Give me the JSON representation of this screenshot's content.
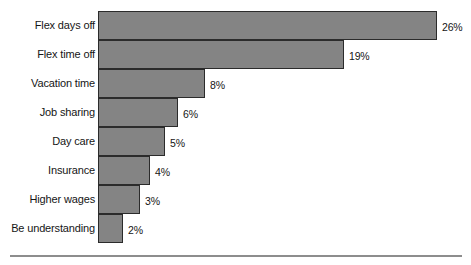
{
  "chart_data": {
    "type": "bar",
    "orientation": "horizontal",
    "title": "",
    "subtitle": "",
    "xlabel": "",
    "ylabel": "",
    "grid": false,
    "legend": false,
    "axis_visible": false,
    "xlim": [
      0,
      26
    ],
    "value_suffix": "%",
    "categories": [
      "Flex days off",
      "Flex time off",
      "Vacation time",
      "Job sharing",
      "Day care",
      "Insurance",
      "Higher wages",
      "Be understanding"
    ],
    "values": [
      26,
      19,
      8,
      6,
      5,
      4,
      3,
      2
    ],
    "value_labels": [
      "26%",
      "19%",
      "8%",
      "6%",
      "5%",
      "4%",
      "3%",
      "2%"
    ],
    "bar_pixel_widths": [
      339,
      246,
      107,
      80,
      67,
      52,
      42,
      25
    ],
    "colors": {
      "bar_fill": "#848484",
      "bar_border": "#2b2b2b",
      "text": "#151515",
      "background": "#ffffff",
      "rule": "#8d8d8d"
    }
  }
}
